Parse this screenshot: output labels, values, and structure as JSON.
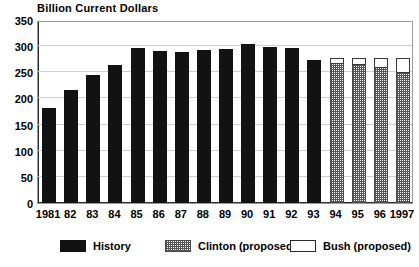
{
  "chart_data": {
    "type": "bar",
    "title": "Billion Current Dollars",
    "subtitle": "",
    "xlabel": "",
    "ylabel": "",
    "ylim": [
      0,
      350
    ],
    "yticks": [
      0,
      50,
      100,
      150,
      200,
      250,
      300,
      350
    ],
    "ytick_labels": [
      "0",
      "50",
      "100",
      "150",
      "200",
      "250",
      "300",
      "350"
    ],
    "grid": true,
    "stacked": true,
    "legend_position": "bottom",
    "categories": [
      "1981",
      "82",
      "83",
      "84",
      "85",
      "86",
      "87",
      "88",
      "89",
      "90",
      "91",
      "92",
      "93",
      "94",
      "95",
      "96",
      "1997"
    ],
    "series": [
      {
        "name": "History",
        "values": [
          181,
          217,
          244,
          264,
          296,
          290,
          288,
          292,
          295,
          305,
          298,
          297,
          273,
          null,
          null,
          null,
          null
        ]
      },
      {
        "name": "Clinton (proposed)",
        "values": [
          null,
          null,
          null,
          null,
          null,
          null,
          null,
          null,
          null,
          null,
          null,
          null,
          null,
          267,
          265,
          261,
          250
        ]
      },
      {
        "name": "Bush (proposed)",
        "values": [
          null,
          null,
          null,
          null,
          null,
          null,
          null,
          null,
          null,
          null,
          null,
          null,
          null,
          278,
          277,
          277,
          277
        ]
      }
    ],
    "legend": [
      {
        "label": "History",
        "swatch": "solid-black"
      },
      {
        "label": "Clinton (proposed)",
        "swatch": "hatched-gray"
      },
      {
        "label": "Bush (proposed)",
        "swatch": "white-outline"
      }
    ],
    "colors": {
      "history": "#121212",
      "clinton": "#777777",
      "bush": "#ffffff",
      "grid": "#cfcfcf",
      "axis": "#2b2b2b",
      "background": "#ffffff"
    }
  }
}
